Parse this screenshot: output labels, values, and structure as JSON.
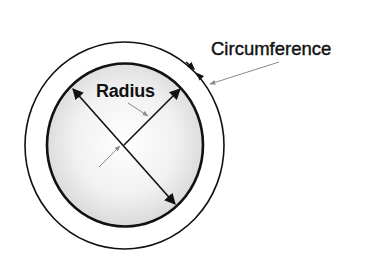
{
  "diagram": {
    "type": "geometry",
    "labels": {
      "radius": "Radius",
      "circumference": "Circumference"
    },
    "colors": {
      "background": "#ffffff",
      "line": "#111111",
      "pointer": "#8a8a8a",
      "fill_center": "#ffffff",
      "fill_edge": "#dcdcdc"
    },
    "elements": [
      {
        "name": "outer-circle",
        "represents": "circumference band"
      },
      {
        "name": "inner-circle",
        "represents": "disk with gradient fill"
      },
      {
        "name": "diameter-line",
        "represents": "double-headed arrow across circle"
      },
      {
        "name": "radius-line",
        "represents": "arrow from center to edge"
      },
      {
        "name": "circumference-arrows",
        "represents": "opposing arrowheads on outer arc"
      },
      {
        "name": "radius-pointer",
        "represents": "gray leader arrow from Radius label"
      },
      {
        "name": "center-pointer",
        "represents": "gray leader arrow to center"
      },
      {
        "name": "circumference-pointer",
        "represents": "gray leader arrow from Circumference label"
      }
    ]
  }
}
